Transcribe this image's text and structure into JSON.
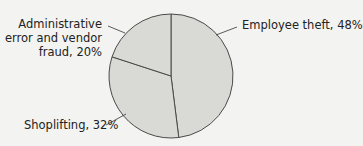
{
  "chart_data": {
    "type": "pie",
    "title": "",
    "categories": [
      "Employee theft",
      "Shoplifting",
      "Administrative error and vendor fraud"
    ],
    "values": [
      48,
      32,
      20
    ],
    "unit": "%",
    "start_angle_deg": 0,
    "direction": "clockwise",
    "colors": {
      "fill": "#d9d9d6",
      "stroke": "#4a4a4a",
      "background": "#f3f3f1"
    },
    "legend": "none (direct labels with leader lines)"
  },
  "labels": {
    "employee": "Employee theft, 48%",
    "shoplifting": "Shoplifting, 32%",
    "admin_line1": "Administrative",
    "admin_line2": "error and vendor",
    "admin_line3": "fraud, 20%"
  }
}
